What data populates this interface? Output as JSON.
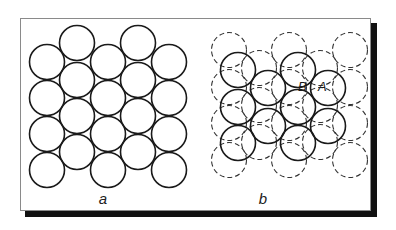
{
  "figure": {
    "panels": [
      {
        "id": "a",
        "label": "a",
        "label_pos": [
          103,
          199
        ],
        "solid_circles": [
          [
            47,
            62
          ],
          [
            47,
            98
          ],
          [
            47,
            134
          ],
          [
            47,
            170
          ],
          [
            77,
            43
          ],
          [
            77,
            80
          ],
          [
            77,
            116
          ],
          [
            77,
            152
          ],
          [
            108,
            62
          ],
          [
            108,
            98
          ],
          [
            108,
            134
          ],
          [
            108,
            170
          ],
          [
            138,
            43
          ],
          [
            138,
            80
          ],
          [
            138,
            116
          ],
          [
            138,
            152
          ],
          [
            169,
            62
          ],
          [
            169,
            98
          ],
          [
            169,
            134
          ],
          [
            169,
            170
          ]
        ],
        "dashed_circles": []
      },
      {
        "id": "b",
        "label": "b",
        "label_pos": [
          263,
          199
        ],
        "dashed_circles": [
          [
            229,
            50
          ],
          [
            229,
            87
          ],
          [
            229,
            123
          ],
          [
            229,
            160
          ],
          [
            259,
            68
          ],
          [
            259,
            105
          ],
          [
            259,
            142
          ],
          [
            289,
            50
          ],
          [
            289,
            87
          ],
          [
            289,
            123
          ],
          [
            289,
            160
          ],
          [
            320,
            68
          ],
          [
            320,
            105
          ],
          [
            320,
            142
          ],
          [
            350,
            50
          ],
          [
            350,
            87
          ],
          [
            350,
            123
          ],
          [
            350,
            160
          ]
        ],
        "solid_circles": [
          [
            238,
            70
          ],
          [
            298,
            70
          ],
          [
            268,
            88
          ],
          [
            328,
            88
          ],
          [
            238,
            107
          ],
          [
            298,
            107
          ],
          [
            268,
            126
          ],
          [
            328,
            126
          ],
          [
            238,
            143
          ],
          [
            298,
            143
          ]
        ],
        "annotations": [
          {
            "text": "B",
            "pos": [
              298,
              91
            ]
          },
          {
            "text": "A",
            "pos": [
              318,
              91
            ]
          }
        ]
      }
    ],
    "circle_radius": 17.5,
    "colors": {
      "stroke": "#1a1a1a",
      "dashed_stroke": "#333333",
      "frame_border": "#8a8a8a",
      "shadow": "#111111"
    }
  }
}
